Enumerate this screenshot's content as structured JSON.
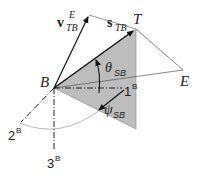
{
  "diagram": {
    "points": {
      "B": "B",
      "T": "T",
      "E": "E"
    },
    "vectors": {
      "velocity": {
        "symbol": "v",
        "subscript": "TB",
        "superscript": "E"
      },
      "line_of_sight": {
        "symbol": "s",
        "subscript": "TB"
      }
    },
    "angles": {
      "elevation": {
        "symbol": "θ",
        "subscript": "SB"
      },
      "azimuth": {
        "symbol": "ψ",
        "subscript": "SB"
      }
    },
    "axes": {
      "axis1": {
        "number": "1",
        "superscript": "B"
      },
      "axis2": {
        "number": "2",
        "superscript": "B"
      },
      "axis3": {
        "number": "3",
        "superscript": "B"
      }
    },
    "colors": {
      "plane_fill": "#bdbdbd",
      "line": "#222222",
      "thin_line": "#666666"
    }
  }
}
